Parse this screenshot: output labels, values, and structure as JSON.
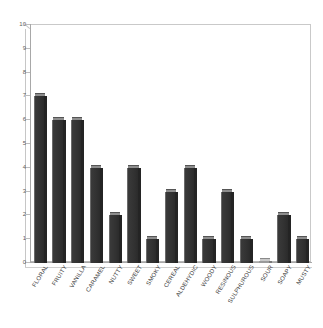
{
  "chart_data": {
    "type": "bar",
    "title": "",
    "xlabel": "",
    "ylabel": "",
    "ylim": [
      0,
      10
    ],
    "ytick_step": 1,
    "grid": false,
    "legend": null,
    "bar_style": "3d-column",
    "bar_color": "#3a3a3a",
    "categories": [
      "FLORAL",
      "FRUITY",
      "VANILLA",
      "CARAMEL",
      "NUTTY",
      "SWEET",
      "SMOKY",
      "CEREAL",
      "ALDEHYDIC",
      "WOODY",
      "RESINOUS",
      "SULPHUROUS",
      "SOUR",
      "SOAPY",
      "MUSTY"
    ],
    "values": [
      7,
      6,
      6,
      4,
      2,
      4,
      1,
      3,
      4,
      1,
      3,
      1,
      0,
      2,
      1
    ],
    "ytick_labels": [
      "0",
      "1",
      "2",
      "3",
      "4",
      "5",
      "6",
      "7",
      "8",
      "9",
      "10"
    ]
  }
}
